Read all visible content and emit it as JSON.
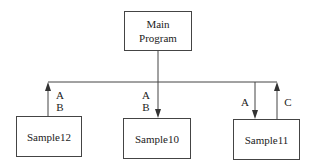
{
  "diagram": {
    "type": "structure-chart",
    "root": {
      "id": "main",
      "label_line1": "Main",
      "label_line2": "Program"
    },
    "modules": [
      {
        "id": "sample12",
        "label": "Sample12"
      },
      {
        "id": "sample10",
        "label": "Sample10"
      },
      {
        "id": "sample11",
        "label": "Sample11"
      }
    ],
    "flows": [
      {
        "module": "sample12",
        "direction": "up",
        "label1": "A",
        "label2": "B"
      },
      {
        "module": "sample10",
        "direction": "down",
        "label1": "A",
        "label2": "B"
      },
      {
        "module": "sample11",
        "direction": "down",
        "label1": "A"
      },
      {
        "module": "sample11",
        "direction": "up",
        "label1": "C"
      }
    ],
    "colors": {
      "line": "#444444",
      "text": "#222222",
      "background": "#ffffff"
    }
  }
}
